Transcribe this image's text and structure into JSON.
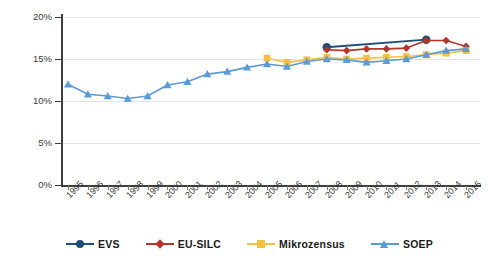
{
  "chart_data": {
    "type": "line",
    "title": "",
    "xlabel": "",
    "ylabel": "",
    "x": [
      1995,
      1996,
      1997,
      1998,
      1999,
      2000,
      2001,
      2002,
      2003,
      2004,
      2005,
      2006,
      2007,
      2008,
      2009,
      2010,
      2011,
      2012,
      2013,
      2014,
      2015
    ],
    "xtick_labels": [
      "1995",
      "1996",
      "1997",
      "1998",
      "1999",
      "2000",
      "2001",
      "2002",
      "2003",
      "2004",
      "2005",
      "2006",
      "2007",
      "2008",
      "2009",
      "2010",
      "2011",
      "2012",
      "2013",
      "2014",
      "2015"
    ],
    "ytick_labels": [
      "0%",
      "5%",
      "10%",
      "15%",
      "20%"
    ],
    "ytick_values": [
      0,
      5,
      10,
      15,
      20
    ],
    "ylim": [
      0,
      20
    ],
    "grid": true,
    "legend_position": "bottom",
    "series": [
      {
        "name": "EVS",
        "color": "#1f4e79",
        "marker": "circle",
        "points": [
          {
            "x": 2008,
            "y": 16.4
          },
          {
            "x": 2013,
            "y": 17.3
          }
        ]
      },
      {
        "name": "EU-SILC",
        "color": "#b5342a",
        "marker": "diamond",
        "points": [
          {
            "x": 2008,
            "y": 16.1
          },
          {
            "x": 2009,
            "y": 16.0
          },
          {
            "x": 2010,
            "y": 16.2
          },
          {
            "x": 2011,
            "y": 16.2
          },
          {
            "x": 2012,
            "y": 16.3
          },
          {
            "x": 2013,
            "y": 17.2
          },
          {
            "x": 2014,
            "y": 17.2
          },
          {
            "x": 2015,
            "y": 16.5
          }
        ]
      },
      {
        "name": "Mikrozensus",
        "color": "#f5c142",
        "marker": "square",
        "points": [
          {
            "x": 2005,
            "y": 15.1
          },
          {
            "x": 2006,
            "y": 14.6
          },
          {
            "x": 2007,
            "y": 14.9
          },
          {
            "x": 2008,
            "y": 15.2
          },
          {
            "x": 2009,
            "y": 15.0
          },
          {
            "x": 2010,
            "y": 15.1
          },
          {
            "x": 2011,
            "y": 15.2
          },
          {
            "x": 2012,
            "y": 15.3
          },
          {
            "x": 2013,
            "y": 15.5
          },
          {
            "x": 2014,
            "y": 15.7
          },
          {
            "x": 2015,
            "y": 16.0
          }
        ]
      },
      {
        "name": "SOEP",
        "color": "#5b9bd5",
        "marker": "triangle",
        "points": [
          {
            "x": 1995,
            "y": 12.0
          },
          {
            "x": 1996,
            "y": 10.8
          },
          {
            "x": 1997,
            "y": 10.6
          },
          {
            "x": 1998,
            "y": 10.3
          },
          {
            "x": 1999,
            "y": 10.6
          },
          {
            "x": 2000,
            "y": 11.9
          },
          {
            "x": 2001,
            "y": 12.3
          },
          {
            "x": 2002,
            "y": 13.2
          },
          {
            "x": 2003,
            "y": 13.5
          },
          {
            "x": 2004,
            "y": 14.0
          },
          {
            "x": 2005,
            "y": 14.4
          },
          {
            "x": 2006,
            "y": 14.1
          },
          {
            "x": 2007,
            "y": 14.7
          },
          {
            "x": 2008,
            "y": 15.0
          },
          {
            "x": 2009,
            "y": 14.9
          },
          {
            "x": 2010,
            "y": 14.6
          },
          {
            "x": 2011,
            "y": 14.8
          },
          {
            "x": 2012,
            "y": 15.0
          },
          {
            "x": 2013,
            "y": 15.5
          },
          {
            "x": 2014,
            "y": 16.0
          },
          {
            "x": 2015,
            "y": 16.2
          }
        ]
      }
    ]
  },
  "legend": {
    "items": [
      {
        "label": "EVS"
      },
      {
        "label": "EU-SILC"
      },
      {
        "label": "Mikrozensus"
      },
      {
        "label": "SOEP"
      }
    ]
  }
}
